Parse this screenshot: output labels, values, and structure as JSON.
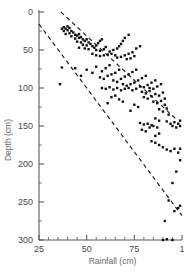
{
  "chart_data": {
    "type": "scatter",
    "title": "",
    "xlabel": "Rainfall (cm)",
    "ylabel": "Depth (cm)",
    "xlim": [
      25,
      100
    ],
    "ylim": [
      0,
      300
    ],
    "y_inverted": true,
    "grid": false,
    "legend": null,
    "x_ticks": [
      25,
      50,
      75,
      100
    ],
    "x_tick_labels": [
      "25",
      "50",
      "75",
      "1"
    ],
    "x_minor_step": 5,
    "y_ticks": [
      0,
      50,
      100,
      150,
      200,
      250,
      300
    ],
    "y_tick_labels": [
      "0",
      "50",
      "100",
      "150",
      "200",
      "250",
      "300"
    ],
    "y_minor_step": 25,
    "marker": "square",
    "marker_color": "#111111",
    "marker_size_px": 2.4,
    "annotations": [
      {
        "name": "upper-envelope",
        "style": "dashed",
        "x": [
          36.5,
          96.5
        ],
        "y": [
          0,
          140
        ]
      },
      {
        "name": "lower-envelope",
        "style": "dashed",
        "x": [
          25.0,
          100.0
        ],
        "y": [
          16,
          268
        ]
      }
    ],
    "points": [
      [
        37,
        22
      ],
      [
        38,
        20
      ],
      [
        39,
        22
      ],
      [
        40,
        19
      ],
      [
        38,
        25
      ],
      [
        40,
        24
      ],
      [
        41,
        21
      ],
      [
        42,
        25
      ],
      [
        39,
        29
      ],
      [
        41,
        28
      ],
      [
        43,
        27
      ],
      [
        44,
        30
      ],
      [
        42,
        32
      ],
      [
        45,
        31
      ],
      [
        46,
        29
      ],
      [
        44,
        35
      ],
      [
        46,
        34
      ],
      [
        47,
        33
      ],
      [
        48,
        36
      ],
      [
        45,
        39
      ],
      [
        47,
        40
      ],
      [
        49,
        38
      ],
      [
        50,
        36
      ],
      [
        51,
        40
      ],
      [
        48,
        43
      ],
      [
        50,
        44
      ],
      [
        52,
        42
      ],
      [
        53,
        45
      ],
      [
        46,
        47
      ],
      [
        49,
        48
      ],
      [
        51,
        49
      ],
      [
        54,
        47
      ],
      [
        55,
        44
      ],
      [
        56,
        41
      ],
      [
        57,
        38
      ],
      [
        58,
        36
      ],
      [
        55,
        50
      ],
      [
        57,
        51
      ],
      [
        59,
        49
      ],
      [
        60,
        46
      ],
      [
        53,
        55
      ],
      [
        55,
        57
      ],
      [
        57,
        58
      ],
      [
        59,
        57
      ],
      [
        61,
        56
      ],
      [
        63,
        55
      ],
      [
        65,
        57
      ],
      [
        62,
        52
      ],
      [
        64,
        50
      ],
      [
        66,
        48
      ],
      [
        67,
        45
      ],
      [
        68,
        42
      ],
      [
        69,
        38
      ],
      [
        70,
        34
      ],
      [
        66,
        60
      ],
      [
        68,
        59
      ],
      [
        70,
        57
      ],
      [
        72,
        55
      ],
      [
        74,
        53
      ],
      [
        71,
        62
      ],
      [
        73,
        61
      ],
      [
        75,
        58
      ],
      [
        72,
        30
      ],
      [
        76,
        48
      ],
      [
        78,
        45
      ],
      [
        44,
        74
      ],
      [
        37,
        73
      ],
      [
        36,
        95
      ],
      [
        47,
        84
      ],
      [
        50,
        76
      ],
      [
        53,
        80
      ],
      [
        55,
        72
      ],
      [
        58,
        78
      ],
      [
        60,
        74
      ],
      [
        62,
        70
      ],
      [
        57,
        86
      ],
      [
        59,
        88
      ],
      [
        61,
        84
      ],
      [
        63,
        82
      ],
      [
        65,
        80
      ],
      [
        67,
        76
      ],
      [
        64,
        90
      ],
      [
        66,
        92
      ],
      [
        68,
        88
      ],
      [
        70,
        85
      ],
      [
        72,
        82
      ],
      [
        74,
        79
      ],
      [
        76,
        76
      ],
      [
        69,
        95
      ],
      [
        71,
        97
      ],
      [
        73,
        95
      ],
      [
        75,
        93
      ],
      [
        77,
        90
      ],
      [
        79,
        87
      ],
      [
        81,
        84
      ],
      [
        78,
        98
      ],
      [
        80,
        99
      ],
      [
        82,
        96
      ],
      [
        84,
        93
      ],
      [
        86,
        90
      ],
      [
        83,
        100
      ],
      [
        85,
        101
      ],
      [
        87,
        98
      ],
      [
        89,
        95
      ],
      [
        58,
        100
      ],
      [
        60,
        101
      ],
      [
        62,
        99
      ],
      [
        64,
        102
      ],
      [
        66,
        100
      ],
      [
        68,
        103
      ],
      [
        70,
        101
      ],
      [
        72,
        100
      ],
      [
        74,
        103
      ],
      [
        76,
        101
      ],
      [
        63,
        112
      ],
      [
        65,
        110
      ],
      [
        67,
        115
      ],
      [
        61,
        120
      ],
      [
        69,
        118
      ],
      [
        79,
        105
      ],
      [
        81,
        107
      ],
      [
        83,
        104
      ],
      [
        80,
        112
      ],
      [
        82,
        114
      ],
      [
        84,
        111
      ],
      [
        86,
        108
      ],
      [
        88,
        110
      ],
      [
        90,
        106
      ],
      [
        85,
        118
      ],
      [
        87,
        120
      ],
      [
        89,
        117
      ],
      [
        91,
        114
      ],
      [
        88,
        128
      ],
      [
        90,
        131
      ],
      [
        92,
        127
      ],
      [
        91,
        122
      ],
      [
        93,
        135
      ],
      [
        86,
        140
      ],
      [
        88,
        143
      ],
      [
        78,
        146
      ],
      [
        80,
        148
      ],
      [
        82,
        147
      ],
      [
        84,
        149
      ],
      [
        83,
        152
      ],
      [
        85,
        150
      ],
      [
        87,
        152
      ],
      [
        79,
        155
      ],
      [
        81,
        157
      ],
      [
        92,
        144
      ],
      [
        94,
        147
      ],
      [
        96,
        145
      ],
      [
        98,
        147
      ],
      [
        99,
        143
      ],
      [
        95,
        150
      ],
      [
        97,
        152
      ],
      [
        99,
        150
      ],
      [
        86,
        163
      ],
      [
        88,
        160
      ],
      [
        84,
        170
      ],
      [
        86,
        172
      ],
      [
        88,
        175
      ],
      [
        90,
        178
      ],
      [
        92,
        181
      ],
      [
        94,
        183
      ],
      [
        96,
        180
      ],
      [
        98,
        185
      ],
      [
        99,
        180
      ],
      [
        99,
        195
      ],
      [
        97,
        210
      ],
      [
        95,
        225
      ],
      [
        93,
        248
      ],
      [
        91,
        275
      ],
      [
        90,
        300
      ],
      [
        92,
        299
      ],
      [
        95,
        300
      ],
      [
        96,
        262
      ],
      [
        98,
        258
      ],
      [
        99,
        255
      ],
      [
        75,
        122
      ],
      [
        77,
        125
      ],
      [
        73,
        130
      ]
    ]
  }
}
